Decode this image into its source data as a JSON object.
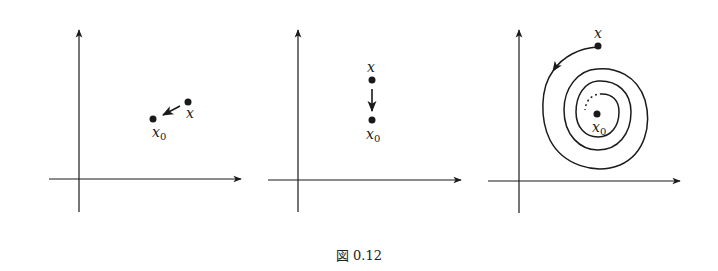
{
  "figure": {
    "caption": "図 0.12",
    "ink_color": "#1a1a1a",
    "panels": [
      {
        "id": "panel-1",
        "description": "point x approaches x0 along a straight arrow",
        "labels": {
          "start": "x",
          "end_base": "x",
          "end_sub": "0"
        }
      },
      {
        "id": "panel-2",
        "description": "point x moves straight down to x0",
        "labels": {
          "start": "x",
          "end_base": "x",
          "end_sub": "0"
        }
      },
      {
        "id": "panel-3",
        "description": "point x spirals inward toward x0",
        "labels": {
          "start": "x",
          "end_base": "x",
          "end_sub": "0"
        }
      }
    ]
  }
}
